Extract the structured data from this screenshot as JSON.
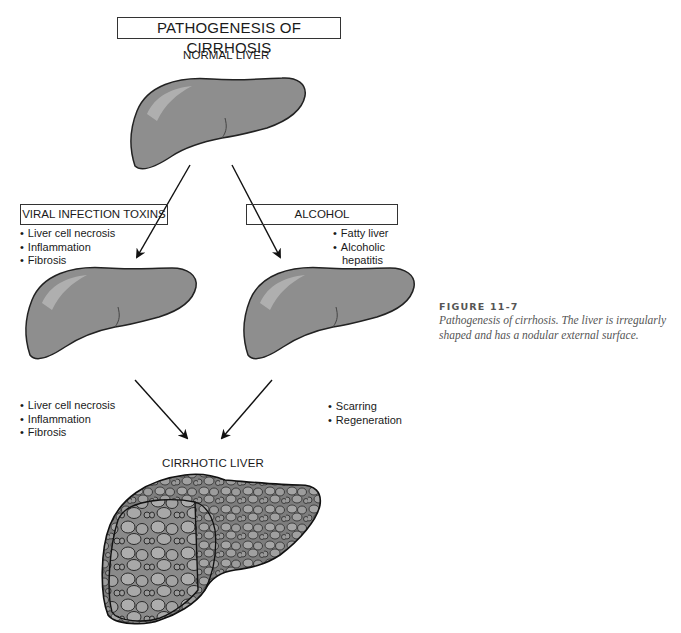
{
  "title": "PATHOGENESIS OF CIRRHOSIS",
  "stages": {
    "normal": {
      "label": "NORMAL LIVER"
    },
    "cirrhotic": {
      "label": "CIRRHOTIC LIVER"
    }
  },
  "branches": {
    "left": {
      "box_label": "VIRAL INFECTION TOXINS",
      "effects": [
        "Liver cell necrosis",
        "Inflammation",
        "Fibrosis"
      ],
      "second_effects": [
        "Liver cell necrosis",
        "Inflammation",
        "Fibrosis"
      ]
    },
    "right": {
      "box_label": "ALCOHOL",
      "effects": [
        "Fatty  liver",
        "Alcoholic",
        "hepatitis"
      ],
      "second_effects": [
        "Scarring",
        "Regeneration"
      ]
    }
  },
  "caption": {
    "figure_number": "FIGURE 11-7",
    "text": "Pathogenesis of cirrhosis. The liver is irregularly shaped and has a nodular external surface."
  },
  "colors": {
    "liver_fill": "#8e8e8e",
    "liver_highlight": "#b8b8b8",
    "outline": "#222222",
    "caption": "#555555"
  }
}
